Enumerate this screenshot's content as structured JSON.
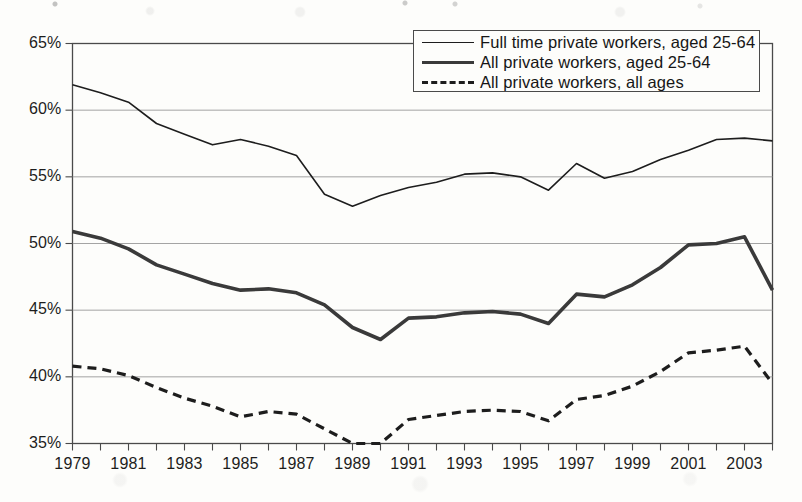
{
  "legend": {
    "position": "top-right",
    "entries": [
      {
        "label": "Full time private workers, aged 25-64",
        "style": "solid-thin"
      },
      {
        "label": "All private workers, aged 25-64",
        "style": "solid-thick"
      },
      {
        "label": "All private workers, all ages",
        "style": "dashed"
      }
    ]
  },
  "axes": {
    "y_ticks": [
      "35%",
      "40%",
      "45%",
      "50%",
      "55%",
      "60%",
      "65%"
    ],
    "x_ticks": [
      "1979",
      "1981",
      "1983",
      "1985",
      "1987",
      "1989",
      "1991",
      "1993",
      "1995",
      "1997",
      "1999",
      "2001",
      "2003"
    ]
  },
  "colors": {
    "line_thin": "#1d1d1d",
    "line_thick": "#3a3a3a",
    "line_dashed": "#1d1d1d",
    "grid": "#9a9a9a",
    "axis": "#4a4a4a",
    "background": "#fdfdfb",
    "text": "#1d1d1d"
  },
  "chart_data": {
    "type": "line",
    "title": "",
    "subtitle": "",
    "xlabel": "",
    "ylabel": "",
    "xlim": [
      1979,
      2004
    ],
    "ylim": [
      35,
      65
    ],
    "ytick_step": 5,
    "ytick_format": "percent",
    "grid": true,
    "legend_position": "top-right",
    "x": [
      1979,
      1980,
      1981,
      1982,
      1983,
      1984,
      1985,
      1986,
      1987,
      1988,
      1989,
      1990,
      1991,
      1992,
      1993,
      1994,
      1995,
      1996,
      1997,
      1998,
      1999,
      2000,
      2001,
      2002,
      2003,
      2004
    ],
    "series": [
      {
        "name": "Full time private workers, aged 25-64",
        "style": "solid-thin",
        "values": [
          61.9,
          61.3,
          60.6,
          59.0,
          58.2,
          57.4,
          57.8,
          57.3,
          56.6,
          53.7,
          52.8,
          53.6,
          54.2,
          54.6,
          55.2,
          55.3,
          55.0,
          54.0,
          56.0,
          54.9,
          55.4,
          56.3,
          57.0,
          57.8,
          57.9,
          57.7
        ],
        "tail_values": [
          53.5,
          54.0,
          53.4
        ]
      },
      {
        "name": "All private workers, aged 25-64",
        "style": "solid-thick",
        "values": [
          50.9,
          50.4,
          49.6,
          48.4,
          47.7,
          47.0,
          46.5,
          46.6,
          46.3,
          45.4,
          43.7,
          42.8,
          44.4,
          44.5,
          44.8,
          44.9,
          44.7,
          44.0,
          46.2,
          46.0,
          46.9,
          48.2,
          49.9,
          50.0,
          50.5,
          46.5
        ],
        "tail_values": [
          46.5,
          47.0,
          46.4
        ]
      },
      {
        "name": "All private workers, all ages",
        "style": "dashed",
        "values": [
          40.8,
          40.6,
          40.1,
          39.2,
          38.4,
          37.8,
          37.0,
          37.4,
          37.2,
          36.1,
          35.0,
          35.0,
          36.8,
          37.1,
          37.4,
          37.5,
          37.4,
          36.7,
          38.3,
          38.6,
          39.3,
          40.4,
          41.8,
          42.0,
          42.3,
          39.5
        ],
        "tail_values": [
          39.5,
          39.6,
          39.5
        ]
      }
    ]
  }
}
